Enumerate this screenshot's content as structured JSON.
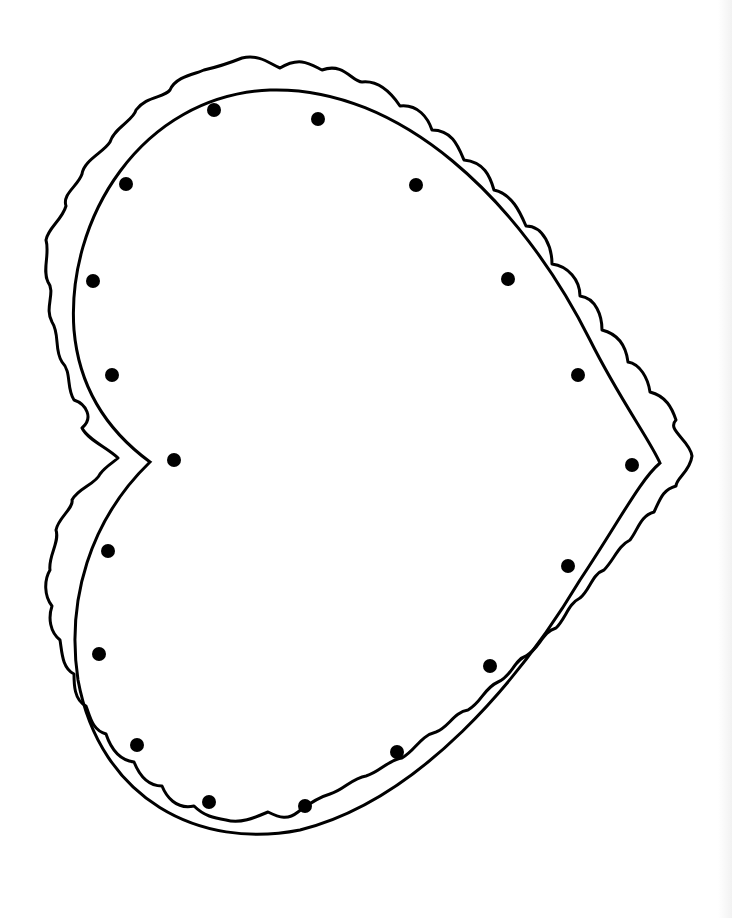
{
  "image": {
    "subject": "Heart lacing card template",
    "orientation": "rotated, point facing right",
    "colors": {
      "background": "#ffffff",
      "line": "#000000"
    }
  },
  "heart": {
    "inner_outline": "smooth heart outline",
    "outer_outline": "scalloped edge",
    "point": [
      660,
      463
    ],
    "notch": [
      150,
      463
    ]
  },
  "dots": [
    [
      214,
      110
    ],
    [
      318,
      119
    ],
    [
      126,
      184
    ],
    [
      416,
      185
    ],
    [
      93,
      281
    ],
    [
      508,
      279
    ],
    [
      112,
      375
    ],
    [
      578,
      375
    ],
    [
      174,
      460
    ],
    [
      632,
      465
    ],
    [
      108,
      551
    ],
    [
      568,
      566
    ],
    [
      99,
      654
    ],
    [
      490,
      666
    ],
    [
      137,
      745
    ],
    [
      397,
      752
    ],
    [
      209,
      802
    ],
    [
      305,
      806
    ]
  ],
  "dot_radius": 7
}
